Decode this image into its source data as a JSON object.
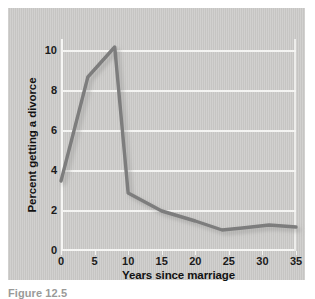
{
  "figure": {
    "caption": "Figure 12.5",
    "panel_color": "#c9c8c6",
    "line_color": "#7d7d7d",
    "grid_color": "#f4f4f2"
  },
  "chart_data": {
    "type": "line",
    "title": "",
    "xlabel": "Years since marriage",
    "ylabel": "Percent getting a divorce",
    "xlim": [
      0,
      35
    ],
    "ylim": [
      0,
      10.6
    ],
    "xticks": [
      0,
      5,
      10,
      15,
      20,
      25,
      30,
      35
    ],
    "yticks": [
      0,
      2,
      4,
      6,
      8,
      10
    ],
    "xtick_labels": [
      "0",
      "5",
      "10",
      "15",
      "20",
      "25",
      "30",
      "35"
    ],
    "ytick_labels": [
      "0",
      "2",
      "4",
      "6",
      "8",
      "10"
    ],
    "grid": "horizontal",
    "legend": "none",
    "series": [
      {
        "name": "Percent getting a divorce",
        "color": "#7d7d7d",
        "x": [
          0,
          4,
          8,
          10,
          15,
          20,
          24,
          27,
          31,
          35
        ],
        "values": [
          3.5,
          8.7,
          10.2,
          2.9,
          2.0,
          1.5,
          1.05,
          1.15,
          1.3,
          1.2
        ]
      }
    ]
  }
}
